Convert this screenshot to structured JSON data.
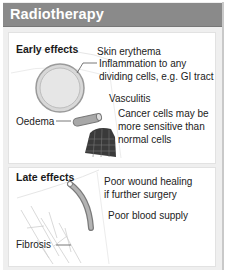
{
  "header": {
    "title": "Radiotherapy",
    "background": "#8a8a8a"
  },
  "early_effects": {
    "title": "Early effects",
    "labels": {
      "skin": "Skin erythema",
      "inflammation_1": "Inflammation to any",
      "inflammation_2": "dividing cells, e.g. GI tract",
      "vasculitis": "Vasculitis",
      "oedema": "Oedema",
      "cancer_1": "Cancer  cells may be",
      "cancer_2": "more sensitive than",
      "cancer_3": "normal cells"
    },
    "icons": [
      "cell-circle-icon",
      "blood-vessel-icon",
      "tumour-mass-icon"
    ]
  },
  "late_effects": {
    "title": "Late effects",
    "labels": {
      "wound_1": "Poor wound healing",
      "wound_2": "if further surgery",
      "blood": "Poor blood supply",
      "fibrosis": "Fibrosis"
    },
    "icons": [
      "narrowed-vessel-icon",
      "fibrous-tissue-icon"
    ]
  }
}
